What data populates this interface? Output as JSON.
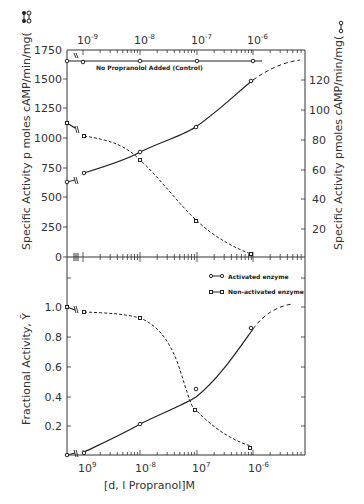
{
  "chart_data": [
    {
      "type": "line",
      "panel": "top",
      "title": "",
      "xlabel": "[d,l Propranol]M",
      "xscale": "log",
      "xlim": [
        5e-10,
        1e-05
      ],
      "x_tick_labels": [
        "10^-9",
        "10^-8",
        "10^-7",
        "10^-6"
      ],
      "ylabel_left": "Specific Activity pmoles cAMP/min/mg (●–●)",
      "ylabel_right": "Specific Activity pmoles cAMP/min/mg (○–○)",
      "ylim_left": [
        0,
        1750
      ],
      "ylim_right": [
        0,
        140
      ],
      "y_ticks_left": [
        0,
        250,
        500,
        750,
        1000,
        1250,
        1500,
        1750
      ],
      "y_ticks_right": [
        20,
        40,
        60,
        80,
        100,
        120
      ],
      "annotations": [
        "No Propranolol Added (Control)"
      ],
      "series": [
        {
          "name": "No Propranolol Added (Control)",
          "style": "solid",
          "marker": "circle",
          "x": [
            0,
            1e-09,
            1e-08,
            1e-07,
            1e-06
          ],
          "y": [
            1655,
            1655,
            1655,
            1655,
            1655
          ]
        },
        {
          "name": "Activated enzyme (left axis)",
          "style": "solid",
          "marker": "circle",
          "x": [
            0,
            1e-09,
            1e-08,
            1e-07,
            1e-06
          ],
          "y": [
            640,
            700,
            890,
            1100,
            1480
          ]
        },
        {
          "name": "Non-activated enzyme (right axis)",
          "style": "dashed",
          "marker": "square",
          "x": [
            0,
            1e-09,
            1e-08,
            1e-07,
            1e-06
          ],
          "y": [
            90,
            82,
            66,
            24,
            2
          ]
        }
      ]
    },
    {
      "type": "line",
      "panel": "bottom",
      "title": "",
      "xlabel": "[d,l Propranol]M",
      "xscale": "log",
      "xlim": [
        5e-10,
        1e-05
      ],
      "x_tick_labels": [
        "10^-9",
        "10^-8",
        "10^-7",
        "10^-6"
      ],
      "ylabel": "Fractional Activity, Ȳ",
      "ylim": [
        0,
        1.1
      ],
      "y_ticks": [
        0.2,
        0.4,
        0.6,
        0.8,
        1.0
      ],
      "legend": [
        "Activated enzyme",
        "Non-activated enzyme"
      ],
      "legend_position": "upper right",
      "series": [
        {
          "name": "Activated enzyme",
          "style": "solid",
          "marker": "circle",
          "x": [
            0,
            1e-09,
            1e-08,
            1e-07,
            1e-06
          ],
          "y": [
            0.0,
            0.02,
            0.21,
            0.45,
            0.86
          ]
        },
        {
          "name": "Non-activated enzyme",
          "style": "dashed",
          "marker": "square",
          "x": [
            0,
            1e-09,
            1e-08,
            1e-07,
            1e-06
          ],
          "y": [
            1.0,
            0.96,
            0.89,
            0.3,
            0.05
          ]
        }
      ]
    }
  ],
  "labels": {
    "top_x_ticks": [
      "10",
      "10",
      "10",
      "10"
    ],
    "top_x_exps": [
      "-9",
      "-8",
      "-7",
      "-6"
    ],
    "bottom_x_ticks": [
      "10",
      "10",
      "10",
      "10"
    ],
    "bottom_x_exps": [
      "9",
      "-8",
      "7",
      "-6"
    ],
    "left_y_ticks": [
      "1750",
      "1500",
      "1250",
      "1000",
      "750",
      "500",
      "250",
      "0"
    ],
    "right_y_ticks": [
      "120",
      "100",
      "80",
      "60",
      "40",
      "20"
    ],
    "bottom_y_ticks": [
      "1.0",
      "0.8",
      "0.6",
      "0.4",
      "0.2"
    ],
    "left_y_title": "Specific Activity  p moles cAMP/min/mg(",
    "right_y_title": "Specific Activity  pmoles cAMP/min/mg(",
    "bottom_y_title": "Fractional Activity, Ȳ",
    "x_title": "[d, l Propranol]M",
    "control_label": "No Propranolol Added (Control)",
    "legend_activated": "Activated enzyme",
    "legend_nonactivated": "Non-activated enzyme"
  }
}
